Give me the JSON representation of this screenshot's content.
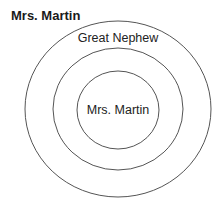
{
  "diagram": {
    "title": "Mrs. Martin",
    "rings": [
      {
        "label": "Great Nephew",
        "level": "outer"
      },
      {
        "label": "",
        "level": "middle"
      },
      {
        "label": "Mrs. Martin",
        "level": "inner"
      }
    ]
  }
}
